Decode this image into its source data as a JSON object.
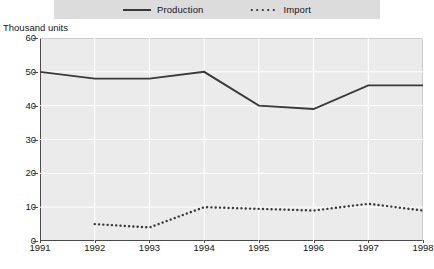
{
  "chart_data": {
    "type": "line",
    "title": "",
    "subtitle": "",
    "ylabel": "Thousand units",
    "xlabel": "",
    "x": [
      1991,
      1992,
      1993,
      1994,
      1995,
      1996,
      1997,
      1998
    ],
    "xlim": [
      1991,
      1998
    ],
    "ylim": [
      0,
      60
    ],
    "yticks": [
      0,
      10,
      20,
      30,
      40,
      50,
      60
    ],
    "xticks": [
      "1991",
      "1992",
      "1993",
      "1994",
      "1995",
      "1996",
      "1997",
      "1998"
    ],
    "grid": true,
    "grid_color": "#ffffff",
    "plot_background": "#ebebeb",
    "legend_position": "top-center",
    "series": [
      {
        "name": "Production",
        "style": "solid",
        "color": "#3a3a3a",
        "x": [
          1991,
          1992,
          1993,
          1994,
          1995,
          1996,
          1997,
          1998
        ],
        "values": [
          50,
          48,
          48,
          50,
          40,
          39,
          46,
          46
        ]
      },
      {
        "name": "Import",
        "style": "dotted",
        "color": "#3a3a3a",
        "x": [
          1992,
          1993,
          1994,
          1995,
          1996,
          1997,
          1998
        ],
        "values": [
          5,
          4,
          10,
          9.5,
          9,
          11,
          9
        ]
      }
    ]
  },
  "legend": {
    "items": [
      {
        "label": "Production",
        "style": "solid"
      },
      {
        "label": "Import",
        "style": "dotted"
      }
    ]
  },
  "axis": {
    "y_title": "Thousand units",
    "y_ticks": [
      "60",
      "50",
      "40",
      "30",
      "20",
      "10",
      "0"
    ],
    "x_ticks": [
      "1991",
      "1992",
      "1993",
      "1994",
      "1995",
      "1996",
      "1997",
      "1998"
    ]
  }
}
